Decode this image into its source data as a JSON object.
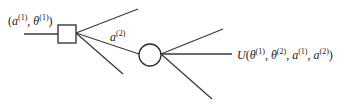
{
  "diagram": {
    "type": "decision-tree",
    "colors": {
      "line": "#3a3a3a",
      "node_fill": "#ffffff",
      "text": "#222222"
    },
    "nodes": [
      {
        "id": "decision",
        "shape": "square",
        "cx": 67,
        "cy": 34,
        "size": 18
      },
      {
        "id": "chance",
        "shape": "circle",
        "cx": 150,
        "cy": 55,
        "r": 11
      }
    ],
    "edges": [
      {
        "id": "input",
        "x1": 24,
        "y1": 34,
        "x2": 58,
        "y2": 34
      },
      {
        "id": "sq-up",
        "x1": 76,
        "y1": 33,
        "x2": 138,
        "y2": 9
      },
      {
        "id": "sq-mid",
        "x1": 76,
        "y1": 33,
        "x2": 139,
        "y2": 54
      },
      {
        "id": "sq-down",
        "x1": 76,
        "y1": 33,
        "x2": 123,
        "y2": 74
      },
      {
        "id": "ci-up",
        "x1": 161,
        "y1": 54,
        "x2": 223,
        "y2": 29
      },
      {
        "id": "ci-mid",
        "x1": 161,
        "y1": 54,
        "x2": 232,
        "y2": 54
      },
      {
        "id": "ci-down",
        "x1": 161,
        "y1": 54,
        "x2": 212,
        "y2": 99
      }
    ],
    "labels": {
      "input": {
        "open": "(",
        "a": "a",
        "a_sup": "(1)",
        "sep": ", ",
        "theta": "θ",
        "theta_sup": "(1)",
        "close": ")"
      },
      "branch": {
        "a": "a",
        "a_sup": "(2)"
      },
      "utility": {
        "U": "U",
        "open": "(",
        "t1": "θ",
        "t1_sup": "(1)",
        "c1": ", ",
        "t2": "θ",
        "t2_sup": "(2)",
        "c2": ", ",
        "a1": "a",
        "a1_sup": "(1)",
        "c3": ", ",
        "a2": "a",
        "a2_sup": "(2)",
        "close": ")"
      }
    }
  }
}
